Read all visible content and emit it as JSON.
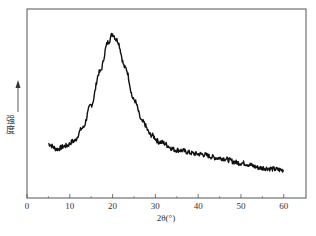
{
  "chart_data": {
    "type": "line",
    "title": "",
    "xlabel": "2θ(°)",
    "ylabel": "强度",
    "ylabel_arrow": "up-arrow",
    "xlim": [
      0,
      65.2
    ],
    "ylim": [
      0,
      189
    ],
    "xticks": [
      0,
      10,
      20,
      30,
      40,
      50,
      60
    ],
    "xtick_labels": [
      "0",
      "10",
      "20",
      "30",
      "40",
      "50",
      "60"
    ],
    "yticks": [],
    "grid": false,
    "legend": null,
    "series": [
      {
        "name": "XRD pattern",
        "color": "#111111",
        "x": [
          5,
          7,
          9,
          11,
          13,
          15,
          17,
          19,
          20,
          21,
          23,
          25,
          27,
          29,
          31,
          35,
          40,
          45,
          50,
          55,
          60
        ],
        "y": [
          54,
          49,
          52,
          57,
          70,
          93,
          126,
          156,
          164,
          158,
          130,
          98,
          76,
          63,
          56,
          48,
          44,
          40,
          35,
          30,
          28
        ]
      }
    ],
    "annotations": [
      {
        "text": "broad peak",
        "x": 20,
        "y": 164
      }
    ]
  },
  "labels": {
    "xlabel": "2θ(°)",
    "ylabel_chars": [
      "强",
      "度"
    ]
  }
}
